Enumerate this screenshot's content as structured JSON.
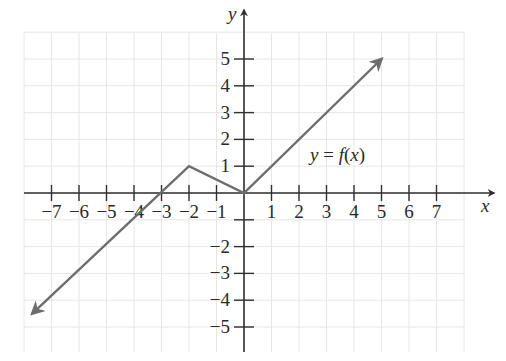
{
  "chart_data": {
    "type": "line",
    "title": "",
    "xlabel": "x",
    "ylabel": "y",
    "xlim": [
      -8.0,
      9.0
    ],
    "ylim": [
      -6.0,
      6.5
    ],
    "grid": true,
    "x_ticks": [
      -7,
      -6,
      -5,
      -4,
      -3,
      -2,
      -1,
      1,
      2,
      3,
      4,
      5,
      6,
      7
    ],
    "y_ticks": [
      -5,
      -4,
      -3,
      -2,
      1,
      2,
      3,
      4,
      5
    ],
    "x_tick_labels": [
      "−7",
      "−6",
      "−5",
      "−4",
      "−3",
      "−2",
      "−1",
      "1",
      "2",
      "3",
      "4",
      "5",
      "6",
      "7"
    ],
    "y_tick_labels": [
      "−5",
      "−4",
      "−3",
      "−2",
      "1",
      "2",
      "3",
      "4",
      "5"
    ],
    "series": [
      {
        "name": "y = f(x)",
        "x": [
          -7.7,
          -2,
          0,
          5
        ],
        "y": [
          -4.5,
          1,
          0,
          5
        ],
        "arrows": [
          "start",
          "end"
        ],
        "color": "#6d6d6d"
      }
    ],
    "annotations": [
      {
        "text": "y = f(x)",
        "x": 3.8,
        "y": 1.4
      }
    ],
    "legend": "none"
  },
  "labels": {
    "x_axis": "x",
    "y_axis": "y",
    "function": "y = f(x)"
  },
  "colors": {
    "axis": "#2f2f2f",
    "grid": "#e6e6e6",
    "curve": "#6d6d6d",
    "background": "#ffffff"
  }
}
